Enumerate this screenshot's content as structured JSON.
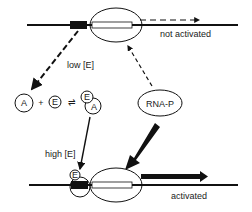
{
  "diagram": {
    "top_gene": {
      "state_label": "not activated"
    },
    "bottom_gene": {
      "state_label": "activated"
    },
    "low_arrow": {
      "label": "low [E]"
    },
    "high_arrow": {
      "label": "high [E]"
    },
    "equation": {
      "reactant_a": "A",
      "plus": "+",
      "reactant_e": "E",
      "equilibrium": "⇌",
      "complex_e": "E",
      "complex_a": "A"
    },
    "polymerase": {
      "label": "RNA-P"
    },
    "bound_factor": {
      "label": "E"
    },
    "colors": {
      "ink": "#111111",
      "background": "#ffffff"
    }
  }
}
